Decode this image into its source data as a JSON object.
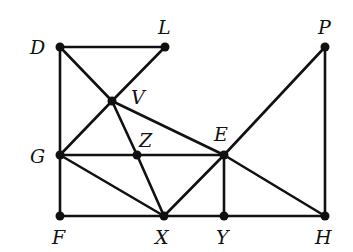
{
  "diagram": {
    "type": "graph",
    "points": [
      {
        "id": "D",
        "label": "D",
        "x": 60,
        "y": 47,
        "lx": 30,
        "ly": 54
      },
      {
        "id": "L",
        "label": "L",
        "x": 165,
        "y": 47,
        "lx": 158,
        "ly": 34
      },
      {
        "id": "P",
        "label": "P",
        "x": 325,
        "y": 47,
        "lx": 318,
        "ly": 34
      },
      {
        "id": "V",
        "label": "V",
        "x": 112,
        "y": 101,
        "lx": 131,
        "ly": 104
      },
      {
        "id": "G",
        "label": "G",
        "x": 60,
        "y": 155,
        "lx": 30,
        "ly": 163
      },
      {
        "id": "Z",
        "label": "Z",
        "x": 137,
        "y": 155,
        "lx": 139,
        "ly": 147
      },
      {
        "id": "E",
        "label": "E",
        "x": 224,
        "y": 155,
        "lx": 214,
        "ly": 141
      },
      {
        "id": "F",
        "label": "F",
        "x": 60,
        "y": 216,
        "lx": 52,
        "ly": 244
      },
      {
        "id": "X",
        "label": "X",
        "x": 164,
        "y": 216,
        "lx": 155,
        "ly": 244
      },
      {
        "id": "Y",
        "label": "Y",
        "x": 224,
        "y": 216,
        "lx": 216,
        "ly": 244
      },
      {
        "id": "H",
        "label": "H",
        "x": 325,
        "y": 216,
        "lx": 315,
        "ly": 244
      }
    ],
    "edges": [
      [
        "D",
        "L"
      ],
      [
        "D",
        "G"
      ],
      [
        "D",
        "V"
      ],
      [
        "L",
        "V"
      ],
      [
        "V",
        "G"
      ],
      [
        "V",
        "Z"
      ],
      [
        "Z",
        "X"
      ],
      [
        "V",
        "E"
      ],
      [
        "G",
        "Z"
      ],
      [
        "Z",
        "E"
      ],
      [
        "G",
        "X"
      ],
      [
        "G",
        "F"
      ],
      [
        "F",
        "X"
      ],
      [
        "X",
        "Y"
      ],
      [
        "Y",
        "H"
      ],
      [
        "X",
        "E"
      ],
      [
        "E",
        "P"
      ],
      [
        "E",
        "Y"
      ],
      [
        "E",
        "H"
      ],
      [
        "P",
        "H"
      ]
    ]
  }
}
